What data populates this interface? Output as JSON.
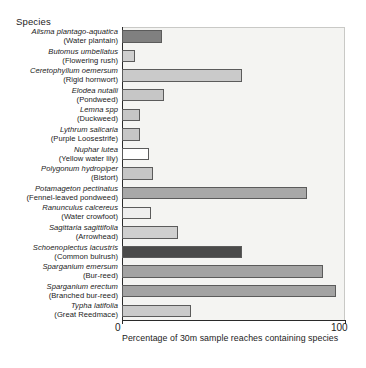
{
  "axis_titles": {
    "y_title": "Species",
    "x_caption": "Percentage of 30m sample reaches containing species"
  },
  "x_ticks": {
    "min_label": "0",
    "max_label": "100"
  },
  "colors": {
    "plot_background": "#f4f4f2",
    "axis": "#2a2a2a",
    "bar_outline": "#5b5b5b",
    "bar_dark": "#4a4a4a",
    "bar_medium_dark": "#808080",
    "bar_medium": "#a8a8a8",
    "bar_light": "#c9c9c9",
    "bar_white": "#ffffff"
  },
  "chart_data": {
    "type": "bar",
    "orientation": "horizontal",
    "title": "",
    "xlabel": "Percentage of 30m sample reaches containing species",
    "ylabel": "Species",
    "xlim": [
      0,
      100
    ],
    "grid": false,
    "legend": "none",
    "categories": [
      "Alisma plantago-aquatica (Water plantain)",
      "Butomus umbellatus (Flowering rush)",
      "Ceretophyllum oemersum (Rigid hornwort)",
      "Elodea nutalli (Pondweed)",
      "Lemna spp (Duckweed)",
      "Lythrum salicaria (Purple Loosestrife)",
      "Nuphar lutea (Yellow water lily)",
      "Polygonum hydropiper (Bistort)",
      "Potamageton pectinatus (Fennel-leaved pondweed)",
      "Ranunculus calcereus (Water crowfoot)",
      "Sagittaria sagittifolia (Arrowhead)",
      "Schoenoplectus lacustris (Common bulrush)",
      "Sparganium emersum (Bur-reed)",
      "Sparganium erectum (Branched bur-reed)",
      "Typha latifolia (Great Reedmace)"
    ],
    "values": [
      18,
      6,
      54,
      19,
      8,
      8,
      12,
      14,
      83,
      13,
      25,
      54,
      90,
      96,
      31
    ]
  },
  "bars": [
    {
      "scientific": "Alisma plantago-aquatica",
      "common": "(Water plantain)",
      "value": 18,
      "fill": "#808080"
    },
    {
      "scientific": "Butomus umbellatus",
      "common": "(Flowering rush)",
      "value": 6,
      "fill": "#cfcfcf"
    },
    {
      "scientific": "Ceretophyllum oemersum",
      "common": "(Rigid hornwort)",
      "value": 54,
      "fill": "#cacaca"
    },
    {
      "scientific": "Elodea nutalli",
      "common": "(Pondweed)",
      "value": 19,
      "fill": "#c6c6c6"
    },
    {
      "scientific": "Lemna spp",
      "common": "(Duckweed)",
      "value": 8,
      "fill": "#c6c6c6"
    },
    {
      "scientific": "Lythrum salicaria",
      "common": "(Purple Loosestrife)",
      "value": 8,
      "fill": "#c6c6c6"
    },
    {
      "scientific": "Nuphar lutea",
      "common": "(Yellow water lily)",
      "value": 12,
      "fill": "#ffffff"
    },
    {
      "scientific": "Polygonum hydropiper",
      "common": "(Bistort)",
      "value": 14,
      "fill": "#c6c6c6"
    },
    {
      "scientific": "Potamageton pectinatus",
      "common": "(Fennel-leaved pondweed)",
      "value": 83,
      "fill": "#a8a8a8"
    },
    {
      "scientific": "Ranunculus calcereus",
      "common": "(Water crowfoot)",
      "value": 13,
      "fill": "#eeeeee"
    },
    {
      "scientific": "Sagittaria sagittifolia",
      "common": "(Arrowhead)",
      "value": 25,
      "fill": "#cfcfcf"
    },
    {
      "scientific": "Schoenoplectus lacustris",
      "common": "(Common bulrush)",
      "value": 54,
      "fill": "#4a4a4a"
    },
    {
      "scientific": "Sparganium emersum",
      "common": "(Bur-reed)",
      "value": 90,
      "fill": "#a3a3a3"
    },
    {
      "scientific": "Sparganium erectum",
      "common": "(Branched bur-reed)",
      "value": 96,
      "fill": "#a3a3a3"
    },
    {
      "scientific": "Typha latifolia",
      "common": "(Great Reedmace)",
      "value": 31,
      "fill": "#cacaca"
    }
  ]
}
